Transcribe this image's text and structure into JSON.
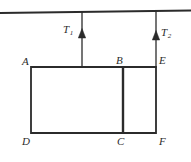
{
  "figure": {
    "background_color": "#ffffff",
    "line_color": "#2b2b2b",
    "ceiling": {
      "name": "ceiling-line",
      "x1": 0,
      "y1": 13,
      "x2": 191,
      "y2": 10.5,
      "stroke_width": 1.8
    },
    "ropes": [
      {
        "id": "rope-1",
        "label": "T",
        "subscript": "1",
        "x": 82,
        "y_top": 12,
        "y_bottom": 68,
        "arrow_tip_y": 29,
        "arrow_base_y": 37,
        "direction": "up"
      },
      {
        "id": "rope-2",
        "label": "T",
        "subscript": "2",
        "x": 156,
        "y_top": 11,
        "y_bottom": 68,
        "arrow_tip_y": 31,
        "arrow_base_y": 39,
        "direction": "up"
      }
    ],
    "blocks": [
      {
        "id": "block-left",
        "vertices": [
          "A",
          "B",
          "C",
          "D"
        ],
        "x": 31,
        "y": 67,
        "width": 92,
        "height": 66
      },
      {
        "id": "block-right",
        "vertices": [
          "B",
          "E",
          "F",
          "C"
        ],
        "x": 123,
        "y": 67,
        "width": 33,
        "height": 66
      }
    ],
    "divider": {
      "id": "divider-bc",
      "x": 123,
      "y_top": 67,
      "y_bottom": 133,
      "stroke_width": 2.4
    },
    "vertices": [
      {
        "id": "A",
        "label": "A",
        "x": 31,
        "y": 67,
        "label_x": 22,
        "label_y": 56
      },
      {
        "id": "B",
        "label": "B",
        "x": 123,
        "y": 67,
        "label_x": 116,
        "label_y": 55
      },
      {
        "id": "E",
        "label": "E",
        "x": 156,
        "y": 67,
        "label_x": 159,
        "label_y": 55
      },
      {
        "id": "D",
        "label": "D",
        "x": 31,
        "y": 133,
        "label_x": 22,
        "label_y": 136
      },
      {
        "id": "C",
        "label": "C",
        "x": 123,
        "y": 133,
        "label_x": 117,
        "label_y": 136
      },
      {
        "id": "F",
        "label": "F",
        "x": 156,
        "y": 133,
        "label_x": 159,
        "label_y": 136
      }
    ],
    "labels": {
      "A": "A",
      "B": "B",
      "C": "C",
      "D": "D",
      "E": "E",
      "F": "F",
      "T1_base": "T",
      "T1_sub": "1",
      "T2_base": "T",
      "T2_sub": "2"
    }
  }
}
